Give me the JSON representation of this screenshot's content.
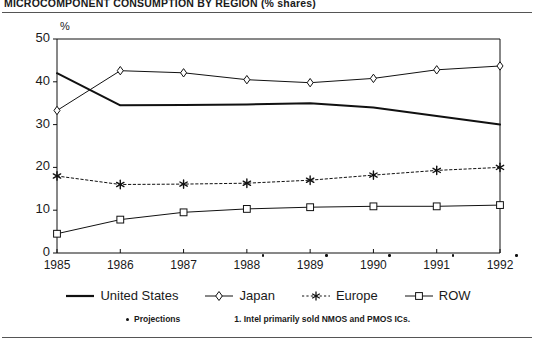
{
  "title": "MICROCOMPONENT CONSUMPTION BY REGION (% shares)",
  "axis": {
    "y_unit": "%",
    "y_ticks": [
      "0",
      "10",
      "20",
      "30",
      "40",
      "50"
    ],
    "x_ticks": [
      "1985",
      "1986",
      "1987",
      "1988",
      "1989",
      "1990",
      "1991",
      "1992"
    ]
  },
  "legend": [
    {
      "label": "United States",
      "marker": "line",
      "color": "#111111"
    },
    {
      "label": "Japan",
      "marker": "diamond",
      "color": "#111111"
    },
    {
      "label": "Europe",
      "marker": "asterisk",
      "color": "#111111"
    },
    {
      "label": "ROW",
      "marker": "square",
      "color": "#111111"
    }
  ],
  "footnotes": {
    "projections_label": "Projections",
    "note_1": "1. Intel primarily sold NMOS and PMOS ICs."
  },
  "chart_data": {
    "type": "line",
    "title": "MICROCOMPONENT CONSUMPTION BY REGION (% shares)",
    "xlabel": "",
    "ylabel": "%",
    "ylim": [
      0,
      50
    ],
    "grid": false,
    "legend_position": "bottom",
    "categories": [
      "1985",
      "1986",
      "1987",
      "1988",
      "1989",
      "1990",
      "1991",
      "1992"
    ],
    "projection_years": [
      "1988",
      "1989",
      "1990",
      "1991",
      "1992"
    ],
    "series": [
      {
        "name": "United States",
        "style": "solid-thick",
        "marker": "none",
        "values": [
          42.0,
          34.5,
          34.6,
          34.7,
          35.0,
          34.0,
          32.0,
          30.0
        ]
      },
      {
        "name": "Japan",
        "style": "solid-thin",
        "marker": "diamond",
        "values": [
          33.3,
          42.6,
          42.1,
          40.5,
          39.8,
          40.8,
          42.8,
          43.7
        ]
      },
      {
        "name": "Europe",
        "style": "dotted",
        "marker": "asterisk",
        "values": [
          18.0,
          16.0,
          16.1,
          16.3,
          17.0,
          18.2,
          19.3,
          20.0
        ]
      },
      {
        "name": "ROW",
        "style": "solid-thin",
        "marker": "square",
        "values": [
          4.5,
          7.8,
          9.5,
          10.3,
          10.7,
          10.9,
          10.9,
          11.2
        ]
      }
    ]
  }
}
